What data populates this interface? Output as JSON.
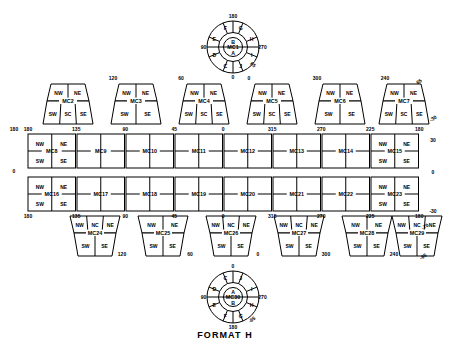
{
  "title": "FORMAT H",
  "diagram": {
    "name": "format-h-map-cell-layout",
    "cell_prefix": "MC"
  },
  "polar_top": {
    "center_label": "MC1",
    "inner_top": "B",
    "inner_bottom": "A",
    "segments": [
      "F",
      "G",
      "H",
      "I",
      "J",
      "C",
      "D",
      "E"
    ],
    "angles": {
      "top": "180",
      "left": "90",
      "right": "270",
      "bottom": "0"
    }
  },
  "polar_bottom": {
    "center_label": "MC30",
    "inner_top": "A",
    "inner_bottom": "B",
    "segments": [
      "C",
      "J",
      "I",
      "H",
      "G",
      "F",
      "E",
      "D"
    ],
    "angles": {
      "top": "0",
      "left": "90",
      "right": "270",
      "bottom": "180",
      "minor": "-65"
    }
  },
  "row_top_trapezoids": [
    {
      "id": "MC2",
      "top": [
        "NW",
        "NE"
      ],
      "bottom": [
        "SW",
        "SC",
        "SE"
      ],
      "angle": "120"
    },
    {
      "id": "MC3",
      "top": [
        "NW",
        "NE"
      ],
      "bottom": [
        "SW",
        "SE"
      ],
      "angle": "60"
    },
    {
      "id": "MC4",
      "top": [
        "NW",
        "NE"
      ],
      "bottom": [
        "SW",
        "SC",
        "SE"
      ],
      "angle": "0"
    },
    {
      "id": "MC5",
      "top": [
        "NW",
        "NE"
      ],
      "bottom": [
        "SW",
        "SC",
        "SE"
      ],
      "angle": "300"
    },
    {
      "id": "MC6",
      "top": [
        "NW",
        "NE"
      ],
      "bottom": [
        "SW",
        "SE"
      ],
      "angle": "240"
    },
    {
      "id": "MC7",
      "top": [
        "NW",
        "NE"
      ],
      "bottom": [
        "SW",
        "SC",
        "SE"
      ],
      "angle": "65"
    }
  ],
  "row_upper_rect": {
    "cells": [
      {
        "id": "MC8",
        "quadrants": [
          "NW",
          "NE",
          "SW",
          "SE"
        ]
      },
      {
        "id": "MC9",
        "quadrants": []
      },
      {
        "id": "MC10",
        "quadrants": []
      },
      {
        "id": "MC11",
        "quadrants": []
      },
      {
        "id": "MC12",
        "quadrants": []
      },
      {
        "id": "MC13",
        "quadrants": []
      },
      {
        "id": "MC14",
        "quadrants": []
      },
      {
        "id": "MC15",
        "quadrants": [
          "NW",
          "NE",
          "SW",
          "SE"
        ]
      }
    ],
    "top_angles": [
      "180",
      "135",
      "90",
      "45",
      "0",
      "315",
      "270",
      "225",
      "180"
    ]
  },
  "row_lower_rect": {
    "cells": [
      {
        "id": "MC16",
        "quadrants": [
          "NW",
          "NE",
          "SW",
          "SE"
        ]
      },
      {
        "id": "MC17",
        "quadrants": []
      },
      {
        "id": "MC18",
        "quadrants": []
      },
      {
        "id": "MC19",
        "quadrants": []
      },
      {
        "id": "MC20",
        "quadrants": []
      },
      {
        "id": "MC21",
        "quadrants": []
      },
      {
        "id": "MC22",
        "quadrants": []
      },
      {
        "id": "MC23",
        "quadrants": [
          "NW",
          "NE",
          "SW",
          "SE"
        ]
      }
    ],
    "bottom_angles": [
      "180",
      "135",
      "90",
      "45",
      "0",
      "315",
      "270",
      "225",
      "180"
    ]
  },
  "row_bottom_trapezoids": [
    {
      "id": "MC24",
      "top": [
        "NW",
        "NC",
        "NE"
      ],
      "bottom": [
        "SW",
        "SE"
      ],
      "angle": "120"
    },
    {
      "id": "MC25",
      "top": [
        "NW",
        "NE"
      ],
      "bottom": [
        "SW",
        "SE"
      ],
      "angle": "60"
    },
    {
      "id": "MC26",
      "top": [
        "NW",
        "NC",
        "NE"
      ],
      "bottom": [
        "SW",
        "SE"
      ],
      "angle": "0"
    },
    {
      "id": "MC27",
      "top": [
        "NW",
        "NC",
        "NE"
      ],
      "bottom": [
        "SW",
        "SE"
      ],
      "angle": "300"
    },
    {
      "id": "MC28",
      "top": [
        "NW",
        "NE"
      ],
      "bottom": [
        "SW",
        "SE"
      ],
      "angle": "240"
    },
    {
      "id": "MC29",
      "top": [
        "NW",
        "NC",
        "NE"
      ],
      "bottom": [
        "SW",
        "SE"
      ],
      "angle": "-65"
    }
  ],
  "edge_angles": {
    "left_upper": "180",
    "left_lower": "0",
    "right_upper": "30",
    "right_lower": "0",
    "right_bottom": "-30",
    "right_top_corner": "180",
    "right_bottom_corner": "180"
  }
}
